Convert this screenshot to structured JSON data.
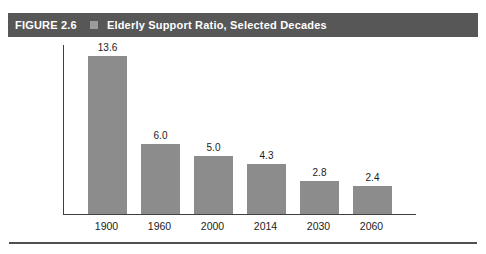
{
  "header": {
    "figure_label": "FIGURE 2.6",
    "title": "Elderly Support Ratio, Selected Decades"
  },
  "chart_data": {
    "type": "bar",
    "title": "Elderly Support Ratio, Selected Decades",
    "categories": [
      "1900",
      "1960",
      "2000",
      "2014",
      "2030",
      "2060"
    ],
    "values": [
      13.6,
      6.0,
      5.0,
      4.3,
      2.8,
      2.4
    ],
    "value_labels": [
      "13.6",
      "6.0",
      "5.0",
      "4.3",
      "2.8",
      "2.4"
    ],
    "xlabel": "",
    "ylabel": "",
    "ylim": [
      0,
      14.6
    ],
    "grid": false,
    "legend": "none"
  },
  "colors": {
    "header_bg": "#575757",
    "header_text": "#ffffff",
    "bullet": "#9b9b9b",
    "bar": "#8c8c8c",
    "axis": "#3f3f3f",
    "label_text": "#1c1c1c",
    "rule": "#4f4f4f"
  }
}
